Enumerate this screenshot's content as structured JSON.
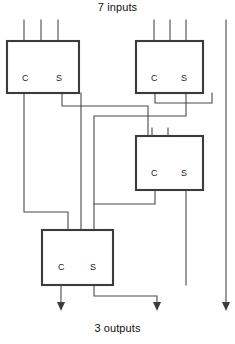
{
  "diagram": {
    "title_top": "7 inputs",
    "title_bottom": "3 outputs",
    "colors": {
      "wire": "#4a4a4a",
      "box_stroke": "#3b3b3b",
      "box_fill": "#ffffff",
      "text": "#1c1c1c",
      "background": "#ffffff"
    },
    "blocks": [
      {
        "id": "counter-1",
        "x": 7,
        "y": 41,
        "w": 72,
        "h": 52,
        "ports": {
          "c_label": "C",
          "s_label": "S"
        },
        "c_label_x": 22,
        "s_label_x": 56,
        "label_y": 81,
        "inputs": 3,
        "input_xs": [
          24,
          41,
          58
        ]
      },
      {
        "id": "counter-2",
        "x": 136,
        "y": 41,
        "w": 67,
        "h": 52,
        "ports": {
          "c_label": "C",
          "s_label": "S"
        },
        "c_label_x": 151,
        "s_label_x": 181,
        "label_y": 81,
        "inputs": 3,
        "input_xs": [
          154,
          170,
          186
        ]
      },
      {
        "id": "counter-3",
        "x": 136,
        "y": 136,
        "w": 67,
        "h": 54,
        "ports": {
          "c_label": "C",
          "s_label": "S"
        },
        "c_label_x": 151,
        "s_label_x": 181,
        "label_y": 176,
        "inputs": 3,
        "input_xs": [
          152,
          168,
          186
        ]
      },
      {
        "id": "counter-4",
        "x": 42,
        "y": 230,
        "w": 71,
        "h": 55,
        "ports": {
          "c_label": "C",
          "s_label": "S"
        },
        "c_label_x": 58,
        "s_label_x": 90,
        "label_y": 270,
        "inputs": 3,
        "input_xs": [
          68,
          81,
          94
        ]
      }
    ],
    "input_stubs": {
      "top_y": 20,
      "count": 7,
      "xs": [
        24,
        41,
        58,
        154,
        170,
        186,
        226
      ]
    },
    "outputs": {
      "count": 3,
      "arrow_xs": [
        61,
        157,
        226
      ],
      "arrow_tip_y": 311
    },
    "wire_paths": [
      "M24,93 L24,212 L68,212 L68,230",
      "M62,93 L62,106 L148,106 L148,136",
      "M81,93 L81,128 L81,230",
      "M155,93 L155,103 L212,103 L212,93",
      "M186,93 L186,116 L94,116 L94,230",
      "M155,190 L155,204 L94,204",
      "M186,190 L186,285",
      "M226,20 L226,305",
      "M61,285 L61,305",
      "M94,285 L94,296 L157,296 L157,305"
    ]
  }
}
